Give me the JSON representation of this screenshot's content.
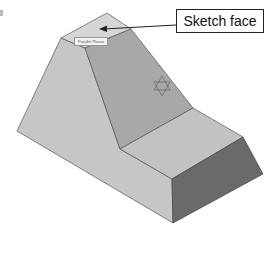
{
  "figure": {
    "callout_label": "Sketch face",
    "tooltip_text": "Parallel Planar",
    "colors": {
      "top_face": "#d6d6d6",
      "left_face": "#c6c6c6",
      "slanted_face": "#a8a8a8",
      "step_top_face": "#c2c2c2",
      "right_face": "#6a6a6a",
      "edge": "#555555",
      "arrow": "#222222",
      "sketch_symbol": "#666666"
    }
  }
}
